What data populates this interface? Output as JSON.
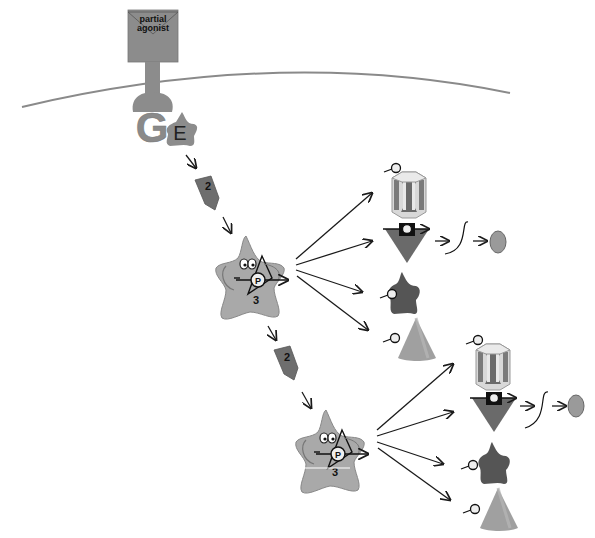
{
  "receptor": {
    "label_line1": "partial",
    "label_line2": "agonist"
  },
  "g_protein": {
    "label": "G"
  },
  "effector": {
    "label": "E"
  },
  "second_messenger": {
    "label": "2"
  },
  "kinase": {
    "label": "3",
    "phospho_label": "P"
  },
  "targets": {
    "phospho_label": "P"
  },
  "colors": {
    "membrane": "#8a8a8a",
    "receptor": "#8c8c8c",
    "messenger": "#6e6e6e",
    "kinase": "#a9a9a9",
    "star_target": "#555555",
    "cone_target": "#9e9e9e",
    "ellipse": "#9a9a9a",
    "arrow": "#1a1a1a"
  },
  "cascades": [
    {
      "id": "upper",
      "messenger_label": "2",
      "kinase_label": "3"
    },
    {
      "id": "lower",
      "messenger_label": "2",
      "kinase_label": "3"
    }
  ]
}
